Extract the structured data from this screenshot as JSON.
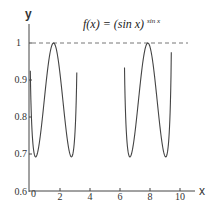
{
  "chart_data": {
    "type": "line",
    "title_parts": {
      "lhs": "f(x) = (sin x)",
      "exponent": "sin x"
    },
    "xlabel": "x",
    "ylabel": "y",
    "xlim": [
      0,
      10.5
    ],
    "ylim": [
      0.6,
      1.0
    ],
    "x_ticks": [
      0,
      2,
      4,
      6,
      8,
      10
    ],
    "y_ticks": [
      0.6,
      0.7,
      0.8,
      0.9,
      1.0
    ],
    "y_tick_labels": [
      "0.6",
      "0.7",
      "0.8",
      "0.9",
      "1"
    ],
    "grid": false,
    "legend": null,
    "reference_line": {
      "y": 1,
      "style": "dashed"
    },
    "series": [
      {
        "name": "branch-1",
        "domain": [
          0.02,
          3.12
        ],
        "x": [
          0.02,
          0.1,
          0.2,
          0.37,
          0.6,
          0.9,
          1.2,
          1.5708,
          1.9,
          2.2,
          2.55,
          2.77,
          2.95,
          3.05,
          3.12
        ],
        "values": [
          0.86,
          0.79,
          0.72,
          0.692,
          0.712,
          0.78,
          0.88,
          1.0,
          0.9,
          0.8,
          0.712,
          0.692,
          0.74,
          0.82,
          0.95
        ]
      },
      {
        "name": "branch-2",
        "domain": [
          6.3,
          9.42
        ],
        "x": [
          6.3,
          6.35,
          6.45,
          6.65,
          6.9,
          7.2,
          7.5,
          7.854,
          8.2,
          8.5,
          8.8,
          9.05,
          9.25,
          9.35,
          9.42
        ],
        "values": [
          0.91,
          0.8,
          0.73,
          0.692,
          0.72,
          0.8,
          0.91,
          1.0,
          0.9,
          0.8,
          0.72,
          0.692,
          0.74,
          0.83,
          0.98
        ]
      }
    ]
  },
  "labels": {
    "y_axis": "y",
    "x_axis": "x",
    "title_lhs": "f(x) = (sin x)",
    "title_exp": "sin x",
    "ytick_1": "1",
    "ytick_09": "0.9",
    "ytick_08": "0.8",
    "ytick_07": "0.7",
    "ytick_06": "0.6",
    "xtick_0": "0",
    "xtick_2": "2",
    "xtick_4": "4",
    "xtick_6": "6",
    "xtick_8": "8",
    "xtick_10": "10"
  },
  "colors": {
    "curve": "#444444",
    "axis": "#444444",
    "dash": "#777777"
  }
}
